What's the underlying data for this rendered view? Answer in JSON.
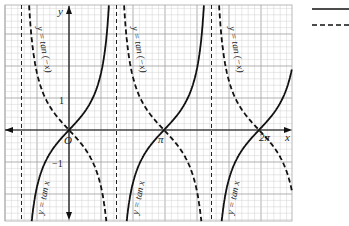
{
  "figure": {
    "title": "",
    "axes": {
      "x_label": "x",
      "y_label": "y",
      "origin_label": "O",
      "x_ticks": [
        {
          "label": "π",
          "value": 3.14159
        },
        {
          "label": "2π",
          "value": 6.28318
        }
      ],
      "y_ticks": [
        {
          "label": "1",
          "value": 1
        },
        {
          "label": "−1",
          "value": -1
        }
      ]
    },
    "curve_labels": {
      "tan_x": "y = tan x",
      "tan_neg_x": "y = tan (−x)"
    },
    "legend": {
      "items": [
        {
          "style": "solid",
          "label": ""
        },
        {
          "style": "dashed",
          "label": ""
        }
      ]
    },
    "colors": {
      "grid_minor": "#d0d0d0",
      "grid_major": "#a8a8a8",
      "curve": "#111111",
      "axis": "#111111"
    }
  },
  "chart_data": {
    "type": "line",
    "title": "",
    "xlabel": "x",
    "ylabel": "y",
    "xlim": [
      -2.2,
      7.1
    ],
    "ylim": [
      -2.85,
      3.9
    ],
    "grid": true,
    "series": [
      {
        "name": "y = tan x",
        "style": "solid",
        "function": "tan(x)"
      },
      {
        "name": "y = tan(−x)",
        "style": "dashed",
        "function": "-tan(x)"
      }
    ],
    "asymptotes_x": [
      -1.5708,
      1.5708,
      4.7124
    ],
    "annotations": [
      "O",
      "π",
      "2π",
      "1",
      "−1"
    ]
  }
}
